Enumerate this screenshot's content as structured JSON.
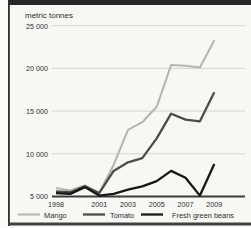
{
  "canvas": {
    "width": 251,
    "height": 228
  },
  "frame": {
    "outer_bg": "#fcfcfa",
    "inner_bg": "#f7f7f4",
    "top_bar_color": "#262626",
    "left_line_color": "#2e2e2e",
    "bottom_bar_color": "#414141"
  },
  "chart_data": {
    "type": "line",
    "title": "metric tonnes",
    "xlabel": "",
    "ylabel": "metric tonnes",
    "x": [
      1998,
      1999,
      2000,
      2001,
      2002,
      2003,
      2004,
      2005,
      2006,
      2007,
      2008,
      2009
    ],
    "x_tick_years": [
      1998,
      2001,
      2003,
      2005,
      2007,
      2009
    ],
    "x_tick_labels": [
      "1998",
      "2001",
      "2003",
      "2005",
      "2007",
      "2009"
    ],
    "ylim": [
      5000,
      25000
    ],
    "yticks": [
      5000,
      10000,
      15000,
      20000,
      25000
    ],
    "ytick_labels": [
      "5 000",
      "10 000",
      "15 000",
      "20 000",
      "25 000"
    ],
    "grid": true,
    "legend_position": "bottom",
    "axis_color": "#3c3c3c",
    "gridline_color": "#cbcbc8",
    "text_color": "#2e2e2e",
    "series": [
      {
        "name": "Mango",
        "color": "#b5b5b3",
        "stroke_width": 2.1,
        "values": [
          6000,
          5700,
          6300,
          5400,
          8700,
          12800,
          13700,
          15500,
          20400,
          20300,
          20100,
          23300
        ]
      },
      {
        "name": "Tomato",
        "color": "#4c4c4a",
        "stroke_width": 2.3,
        "values": [
          5600,
          5500,
          6200,
          5400,
          8000,
          9000,
          9500,
          11800,
          14700,
          14000,
          13800,
          17200
        ]
      },
      {
        "name": "Fresh green beans",
        "color": "#161616",
        "stroke_width": 2.3,
        "values": [
          5400,
          5300,
          6100,
          5100,
          5300,
          5800,
          6200,
          6800,
          8000,
          7200,
          5100,
          8800
        ]
      }
    ]
  }
}
